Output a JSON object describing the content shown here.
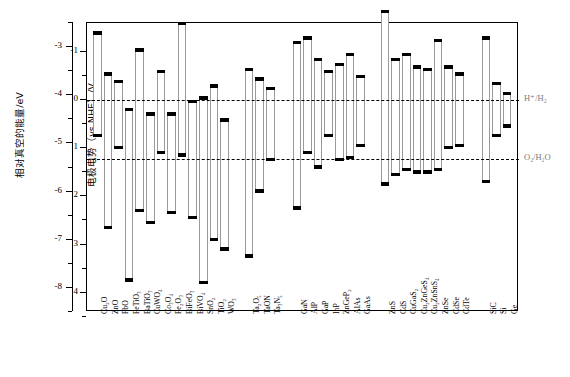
{
  "chart_data": {
    "type": "bar",
    "title": "",
    "xlabel": "",
    "ylabel": "相对真空的能量/eV",
    "ylabel2": "电极电势（vs NHE）/V",
    "grid": false,
    "legend": "none",
    "axis_left": {
      "title": "相对真空的能量/eV",
      "ticks": [
        "-3",
        "-4",
        "-5",
        "-6",
        "-7",
        "-8"
      ],
      "range": [
        -2.5,
        -8.5
      ]
    },
    "axis_right_inner": {
      "title": "电极电势（vs NHE）/V",
      "ticks": [
        "-1",
        "0",
        "1",
        "2",
        "3",
        "4"
      ],
      "range": [
        -1.6,
        4.4
      ]
    },
    "reference_lines": [
      {
        "label": "H⁺/H₂",
        "value": 0.0
      },
      {
        "label": "O₂/H₂O",
        "value": 1.23
      }
    ],
    "groups": [
      {
        "name": "oxides",
        "members": [
          "Cu2O",
          "ZnO",
          "PbO",
          "FeTiO3",
          "BaTiO3",
          "CuWO4",
          "Co3O4",
          "Fe2O3",
          "BiFeO3",
          "BiVO4",
          "SnO2",
          "TiO2",
          "WO3"
        ]
      },
      {
        "name": "oxynitrides-nitrides",
        "members": [
          "Ta2O5",
          "TaON",
          "Ta3N5"
        ]
      },
      {
        "name": "III-V",
        "members": [
          "GaN",
          "AlP",
          "GaP",
          "InP",
          "ZnGeP2",
          "AlAs",
          "GaAs"
        ]
      },
      {
        "name": "chalcogenides",
        "members": [
          "ZnS",
          "CdS",
          "CuGaS2",
          "Cu2ZnGeS4",
          "Cu2ZnSnS4",
          "ZnSe",
          "CdSe",
          "CdTe"
        ]
      },
      {
        "name": "elemental",
        "members": [
          "SiC",
          "Si",
          "Ge"
        ]
      }
    ],
    "materials": [
      {
        "label": "Cu₂O",
        "cb": -1.4,
        "vb": 0.75
      },
      {
        "label": "ZnO",
        "cb": -0.55,
        "vb": 2.65
      },
      {
        "label": "PbO",
        "cb": -0.4,
        "vb": 1.0
      },
      {
        "label": "FeTiO₃",
        "cb": 0.18,
        "vb": 3.75
      },
      {
        "label": "BaTiO₃",
        "cb": -1.05,
        "vb": 2.3
      },
      {
        "label": "CuWO₄",
        "cb": 0.28,
        "vb": 2.55
      },
      {
        "label": "Co₃O₄",
        "cb": -0.6,
        "vb": 1.1
      },
      {
        "label": "Fe₂O₃",
        "cb": 0.28,
        "vb": 2.35
      },
      {
        "label": "BiFeO₃",
        "cb": -1.6,
        "vb": 1.15
      },
      {
        "label": "BiVO₄",
        "cb": 0.02,
        "vb": 2.45
      },
      {
        "label": "SnO₂",
        "cb": -0.05,
        "vb": 3.8
      },
      {
        "label": "TiO₂",
        "cb": -0.3,
        "vb": 2.9
      },
      {
        "label": "WO₃",
        "cb": 0.4,
        "vb": 3.1
      },
      {
        "label": "Ta₂O₅",
        "cb": -0.65,
        "vb": 3.25
      },
      {
        "label": "TaON",
        "cb": -0.45,
        "vb": 1.9
      },
      {
        "label": "Ta₃N₅",
        "cb": -0.25,
        "vb": 1.25
      },
      {
        "label": "GaN",
        "cb": -1.2,
        "vb": 2.25
      },
      {
        "label": "AlP",
        "cb": -1.3,
        "vb": 1.1
      },
      {
        "label": "GaP",
        "cb": -0.85,
        "vb": 1.4
      },
      {
        "label": "InP",
        "cb": -0.6,
        "vb": 0.75
      },
      {
        "label": "ZnGeP₂",
        "cb": -0.75,
        "vb": 1.25
      },
      {
        "label": "AlAs",
        "cb": -0.95,
        "vb": 1.2
      },
      {
        "label": "GaAs",
        "cb": -0.5,
        "vb": 0.95
      },
      {
        "label": "ZnS",
        "cb": -1.85,
        "vb": 1.75
      },
      {
        "label": "CdS",
        "cb": -0.85,
        "vb": 1.55
      },
      {
        "label": "CuGaS₂",
        "cb": -0.95,
        "vb": 1.45
      },
      {
        "label": "Cu₂ZnGeS₄",
        "cb": -0.7,
        "vb": 1.5
      },
      {
        "label": "Cu₂ZnSnS₄",
        "cb": -0.65,
        "vb": 1.5
      },
      {
        "label": "ZnSe",
        "cb": -1.25,
        "vb": 1.45
      },
      {
        "label": "CdSe",
        "cb": -0.7,
        "vb": 1.0
      },
      {
        "label": "CdTe",
        "cb": -0.55,
        "vb": 0.95
      },
      {
        "label": "SiC",
        "cb": -1.3,
        "vb": 1.7
      },
      {
        "label": "Si",
        "cb": -0.35,
        "vb": 0.75
      },
      {
        "label": "Ge",
        "cb": -0.15,
        "vb": 0.55
      }
    ]
  }
}
